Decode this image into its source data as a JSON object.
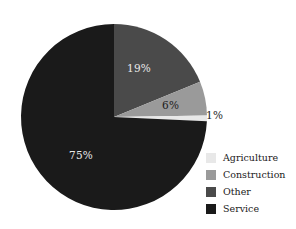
{
  "chart_data": {
    "type": "pie",
    "title": "",
    "subtitle": "",
    "labels": [
      "Agriculture",
      "Construction",
      "Other",
      "Service"
    ],
    "values": [
      1,
      6,
      19,
      75
    ],
    "value_labels": [
      "1%",
      "6%",
      "19%",
      "75%"
    ],
    "colors": [
      "#e8e8e8",
      "#9a9a9a",
      "#4a4a4a",
      "#1a1a1a"
    ],
    "legend_position": "right",
    "grid": false,
    "start_angle_deg": 0,
    "direction": "clockwise",
    "slice_order_clockwise_from_top": [
      "Other",
      "Construction",
      "Agriculture",
      "Service"
    ],
    "annotations": {
      "agriculture_label_outside": true
    }
  },
  "pie": {
    "slices": [
      {
        "key": "other",
        "name": "Other",
        "value": 19,
        "value_label": "19%",
        "color": "#4a4a4a"
      },
      {
        "key": "construction",
        "name": "Construction",
        "value": 6,
        "value_label": "6%",
        "color": "#9a9a9a"
      },
      {
        "key": "agriculture",
        "name": "Agriculture",
        "value": 1,
        "value_label": "1%",
        "color": "#e8e8e8"
      },
      {
        "key": "service",
        "name": "Service",
        "value": 75,
        "value_label": "75%",
        "color": "#1a1a1a"
      }
    ],
    "geometry": {
      "cx": 114,
      "cy": 117,
      "r": 93
    }
  },
  "legend": {
    "items": [
      {
        "label": "Agriculture",
        "color": "#e8e8e8",
        "swatch_name": "legend-swatch-agriculture"
      },
      {
        "label": "Construction",
        "color": "#9a9a9a",
        "swatch_name": "legend-swatch-construction"
      },
      {
        "label": "Other",
        "color": "#4a4a4a",
        "swatch_name": "legend-swatch-other"
      },
      {
        "label": "Service",
        "color": "#1a1a1a",
        "swatch_name": "legend-swatch-service"
      }
    ]
  },
  "theme": {
    "background": "#ffffff",
    "text": "#1a1a1a",
    "label_on_dark": "#e9e9e9",
    "label_on_mid": "#202020"
  }
}
